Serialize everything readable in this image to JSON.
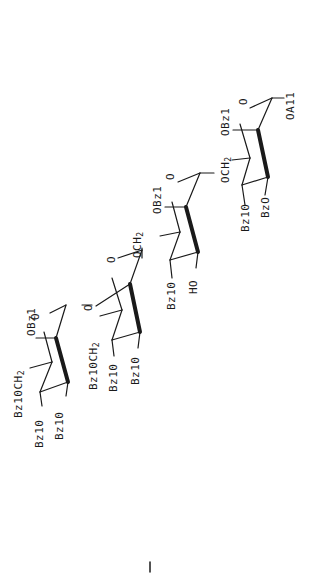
{
  "figure": {
    "type": "chemical-structure",
    "orientation": "rotated-90-ccw",
    "ink_color": "#1a1a1a",
    "background": "#ffffff"
  },
  "rings": [
    {
      "id": "ring-1",
      "labels": {
        "anomeric": "OA11",
        "c2": "OBz1",
        "c6": "OCH",
        "c6_sub": "2",
        "c3": "Bz10",
        "c4": "BzO"
      }
    },
    {
      "id": "ring-2",
      "labels": {
        "ring_o": "O",
        "c2": "OBz1",
        "c6": "OCH",
        "c6_sub": "2",
        "c3": "Bz10",
        "c4": "HO"
      }
    },
    {
      "id": "ring-3",
      "labels": {
        "ring_o": "O",
        "glyco_o": "O",
        "c6": "Bz10CH",
        "c6_sub": "2",
        "c3": "Bz10",
        "c4": "Bz10"
      }
    },
    {
      "id": "ring-4",
      "labels": {
        "ring_o": "O",
        "c2": "OBz1",
        "c6": "Bz10CH",
        "c6_sub": "2",
        "c3": "Bz10",
        "c4": "Bz10"
      }
    }
  ],
  "footer_mark": "|"
}
